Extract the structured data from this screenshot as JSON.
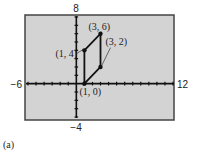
{
  "chart_data": {
    "type": "line",
    "title": "",
    "caption": "(a)",
    "xlabel": "",
    "ylabel": "",
    "xlim": [
      -6,
      12
    ],
    "ylim": [
      -4,
      8
    ],
    "grid": false,
    "tick_marks": {
      "x_step": 1,
      "y_step": 1
    },
    "axis_labels": {
      "xmin": "−6",
      "xmax": "12",
      "ymin": "−4",
      "ymax": "8"
    },
    "background": "#d3d3d3",
    "series": [
      {
        "name": "parallelogram",
        "closed": true,
        "points": [
          {
            "x": 1,
            "y": 0,
            "label": "(1, 0)"
          },
          {
            "x": 3,
            "y": 2,
            "label": "(3, 2)"
          },
          {
            "x": 3,
            "y": 6,
            "label": "(3, 6)"
          },
          {
            "x": 1,
            "y": 4,
            "label": "(1, 4)"
          }
        ]
      }
    ]
  }
}
